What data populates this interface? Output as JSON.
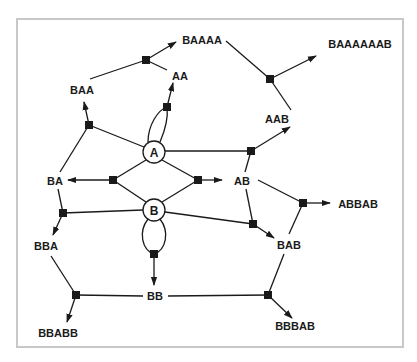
{
  "diagram": {
    "frame_color": "#c8c8c8",
    "line_color": "#1a1a1a",
    "circles": [
      {
        "id": "A",
        "label": "A"
      },
      {
        "id": "B",
        "label": "B"
      }
    ],
    "labels": {
      "BAAAA": "BAAAA",
      "BAAAAAAB": "BAAAAAAB",
      "AA": "AA",
      "BAA": "BAA",
      "AAB": "AAB",
      "BA": "BA",
      "AB": "AB",
      "ABBAB": "ABBAB",
      "BBA": "BBA",
      "BAB": "BAB",
      "BB": "BB",
      "BBABB": "BBABB",
      "BBBAB": "BBBAB"
    }
  }
}
